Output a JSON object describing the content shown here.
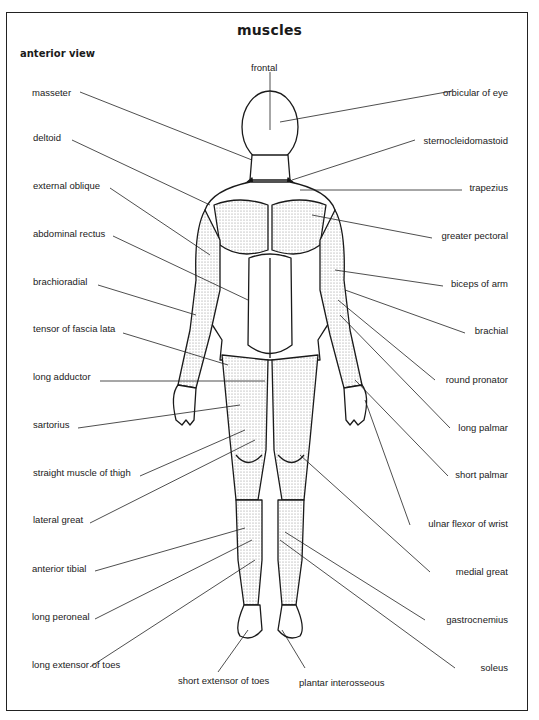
{
  "title": "muscles",
  "subtitle": "anterior view",
  "top_label": "frontal",
  "left_labels": [
    {
      "text": "masseter",
      "x": 32,
      "y": 90
    },
    {
      "text": "deltoid",
      "x": 33,
      "y": 135
    },
    {
      "text": "external oblique",
      "x": 33,
      "y": 183
    },
    {
      "text": "abdominal rectus",
      "x": 33,
      "y": 230
    },
    {
      "text": "brachioradial",
      "x": 33,
      "y": 278
    },
    {
      "text": "tensor of fascia lata",
      "x": 33,
      "y": 325
    },
    {
      "text": "long adductor",
      "x": 33,
      "y": 373
    },
    {
      "text": "sartorius",
      "x": 33,
      "y": 420
    },
    {
      "text": "straight muscle of thigh",
      "x": 33,
      "y": 469
    },
    {
      "text": "lateral great",
      "x": 33,
      "y": 516
    },
    {
      "text": "anterior tibial",
      "x": 33,
      "y": 565
    },
    {
      "text": "long peroneal",
      "x": 33,
      "y": 613
    },
    {
      "text": "long extensor of toes",
      "x": 33,
      "y": 661
    }
  ],
  "right_labels": [
    {
      "text": "orbicular of eye",
      "right": 31,
      "y": 90
    },
    {
      "text": "sternocleidomastoid",
      "right": 31,
      "y": 137
    },
    {
      "text": "trapezius",
      "right": 31,
      "y": 184
    },
    {
      "text": "greater pectoral",
      "right": 31,
      "y": 232
    },
    {
      "text": "biceps of arm",
      "right": 31,
      "y": 280
    },
    {
      "text": "brachial",
      "right": 31,
      "y": 327
    },
    {
      "text": "round pronator",
      "right": 31,
      "y": 376
    },
    {
      "text": "long palmar",
      "right": 31,
      "y": 424
    },
    {
      "text": "short palmar",
      "right": 31,
      "y": 471
    },
    {
      "text": "ulnar flexor of wrist",
      "right": 31,
      "y": 519
    },
    {
      "text": "medial great",
      "right": 31,
      "y": 567
    },
    {
      "text": "gastrocnemius",
      "right": 31,
      "y": 615
    },
    {
      "text": "soleus",
      "right": 31,
      "y": 663
    }
  ],
  "bottom_labels": [
    {
      "text": "short extensor of toes",
      "x": 178,
      "y": 675
    },
    {
      "text": "plantar interosseous",
      "x": 298,
      "y": 677
    }
  ]
}
